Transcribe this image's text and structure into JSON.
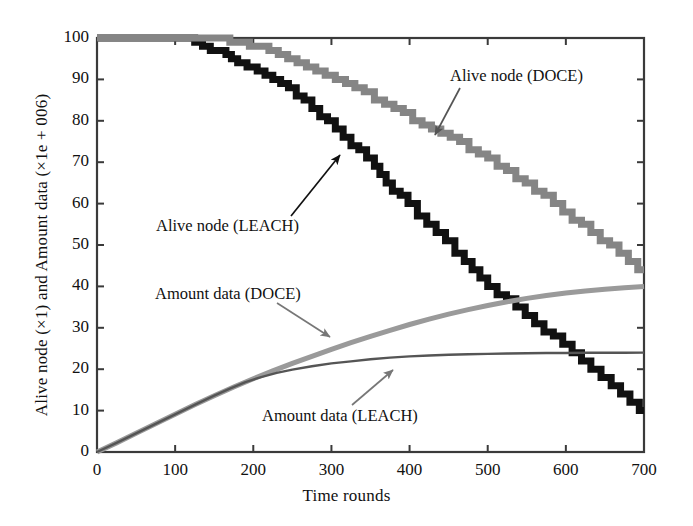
{
  "chart_data": {
    "type": "line",
    "title": "",
    "xlabel": "Time rounds",
    "ylabel": "Alive node (×1) and Amount data (×1e + 006)",
    "xlim": [
      0,
      700
    ],
    "ylim": [
      0,
      100
    ],
    "xticks": [
      0,
      100,
      200,
      300,
      400,
      500,
      600,
      700
    ],
    "yticks": [
      0,
      10,
      20,
      30,
      40,
      50,
      60,
      70,
      80,
      90,
      100
    ],
    "grid": false,
    "legend": "annotations-with-arrows",
    "colors": {
      "alive_leach": "#111111",
      "alive_doce": "#858585",
      "data_doce": "#9a9a9a",
      "data_leach": "#555555",
      "axis": "#3a3a3a",
      "text": "#111111"
    },
    "series": [
      {
        "name": "Alive node (LEACH)",
        "color": "#111111",
        "width": 7,
        "x": [
          0,
          40,
          80,
          118,
          125,
          135,
          145,
          155,
          165,
          172,
          180,
          192,
          205,
          215,
          225,
          235,
          245,
          255,
          265,
          275,
          285,
          295,
          305,
          315,
          325,
          335,
          345,
          355,
          362,
          370,
          378,
          388,
          398,
          410,
          422,
          434,
          446,
          458,
          470,
          480,
          490,
          500,
          512,
          524,
          536,
          548,
          560,
          572,
          584,
          596,
          608,
          620,
          632,
          645,
          658,
          670,
          682,
          694,
          700
        ],
        "y": [
          100,
          100,
          100,
          100,
          99,
          98,
          97,
          97,
          96,
          95,
          94,
          93,
          92,
          91,
          90,
          89,
          88,
          86,
          85,
          83,
          81,
          80,
          78,
          76,
          74,
          73,
          71,
          69,
          67,
          65,
          63,
          62,
          60,
          57,
          55,
          53,
          51,
          48,
          46,
          44,
          42,
          40,
          38,
          37,
          35,
          33,
          31,
          29,
          28,
          26,
          24,
          22,
          20,
          18,
          16,
          14,
          12,
          10,
          10
        ]
      },
      {
        "name": "Alive node (DOCE)",
        "color": "#858585",
        "width": 7,
        "x": [
          0,
          50,
          100,
          140,
          160,
          170,
          182,
          195,
          208,
          220,
          232,
          244,
          256,
          268,
          280,
          292,
          305,
          318,
          330,
          342,
          355,
          368,
          380,
          392,
          404,
          416,
          428,
          440,
          452,
          464,
          476,
          488,
          500,
          512,
          524,
          536,
          548,
          560,
          572,
          584,
          596,
          608,
          620,
          632,
          644,
          656,
          668,
          680,
          692,
          700
        ],
        "y": [
          100,
          100,
          100,
          100,
          100,
          99,
          99,
          98,
          98,
          97,
          96,
          95,
          94,
          93,
          92,
          91,
          90,
          89,
          88,
          87,
          85,
          84,
          83,
          82,
          80,
          79,
          78,
          77,
          76,
          75,
          73,
          72,
          71,
          69,
          68,
          66,
          65,
          63,
          62,
          60,
          58,
          56,
          55,
          53,
          51,
          50,
          48,
          46,
          44,
          44
        ]
      },
      {
        "name": "Amount data (DOCE)",
        "color": "#9a9a9a",
        "width": 5,
        "x": [
          0,
          25,
          50,
          75,
          100,
          125,
          150,
          175,
          200,
          225,
          250,
          275,
          300,
          325,
          350,
          375,
          400,
          425,
          450,
          475,
          500,
          525,
          550,
          575,
          600,
          625,
          650,
          675,
          700
        ],
        "y": [
          0,
          2.2,
          4.5,
          6.8,
          9.1,
          11.4,
          13.6,
          15.7,
          17.7,
          19.6,
          21.4,
          23.1,
          24.8,
          26.4,
          27.9,
          29.4,
          30.8,
          32.1,
          33.3,
          34.4,
          35.4,
          36.3,
          37.1,
          37.8,
          38.4,
          38.9,
          39.3,
          39.7,
          40.0
        ]
      },
      {
        "name": "Amount data (LEACH)",
        "color": "#555555",
        "width": 2.4,
        "x": [
          0,
          25,
          50,
          75,
          100,
          125,
          150,
          170,
          190,
          210,
          230,
          250,
          275,
          300,
          325,
          350,
          375,
          400,
          425,
          450,
          475,
          500,
          525,
          550,
          575,
          600,
          625,
          650,
          675,
          700
        ],
        "y": [
          0,
          2.2,
          4.5,
          6.8,
          9.1,
          11.4,
          13.6,
          15.3,
          16.9,
          18.1,
          19.1,
          19.9,
          20.7,
          21.4,
          21.9,
          22.4,
          22.8,
          23.1,
          23.3,
          23.5,
          23.6,
          23.7,
          23.8,
          23.85,
          23.9,
          23.93,
          23.96,
          23.98,
          23.99,
          24.0
        ]
      }
    ],
    "annotations": [
      {
        "text": "Alive node (DOCE)",
        "text_x": 450,
        "text_y": 78,
        "arrow_from_x": 460,
        "arrow_from_y": 88,
        "arrow_to_x": 435,
        "arrow_to_y": 135,
        "color": "#555555"
      },
      {
        "text": "Alive node (LEACH)",
        "text_x": 156,
        "text_y": 228,
        "arrow_from_x": 291,
        "arrow_from_y": 216,
        "arrow_to_x": 340,
        "arrow_to_y": 155,
        "color": "#111111"
      },
      {
        "text": "Amount data (DOCE)",
        "text_x": 155,
        "text_y": 296,
        "arrow_from_x": 277,
        "arrow_from_y": 303,
        "arrow_to_x": 330,
        "arrow_to_y": 337,
        "color": "#777777"
      },
      {
        "text": "Amount data (LEACH)",
        "text_x": 262,
        "text_y": 418,
        "arrow_from_x": 352,
        "arrow_from_y": 405,
        "arrow_to_x": 393,
        "arrow_to_y": 370,
        "color": "#777777"
      }
    ]
  },
  "plot_geometry": {
    "left": 97,
    "right": 644,
    "top": 38,
    "bottom": 452
  }
}
